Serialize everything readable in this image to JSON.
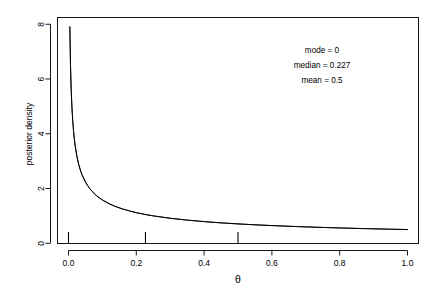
{
  "chart_data": {
    "type": "line",
    "title": "",
    "xlabel": "θ",
    "ylabel": "posterior density",
    "xlim": [
      0,
      1
    ],
    "ylim": [
      0,
      8
    ],
    "grid": false,
    "legend": "none",
    "xticks": [
      "0.0",
      "0.2",
      "0.4",
      "0.6",
      "0.8",
      "1.0"
    ],
    "xtick_values": [
      0.0,
      0.2,
      0.4,
      0.6,
      0.8,
      1.0
    ],
    "yticks": [
      "0",
      "2",
      "4",
      "6",
      "8"
    ],
    "ytick_values": [
      0,
      2,
      4,
      6,
      8
    ],
    "series": [
      {
        "name": "posterior density",
        "formula": "0.5 * theta^(-0.5)",
        "x": [
          0.004,
          0.006,
          0.008,
          0.01,
          0.0125,
          0.015,
          0.0175,
          0.02,
          0.025,
          0.03,
          0.035,
          0.04,
          0.05,
          0.06,
          0.07,
          0.08,
          0.09,
          0.1,
          0.12,
          0.14,
          0.16,
          0.18,
          0.2,
          0.227,
          0.25,
          0.3,
          0.35,
          0.4,
          0.45,
          0.5,
          0.55,
          0.6,
          0.65,
          0.7,
          0.75,
          0.8,
          0.85,
          0.9,
          0.95,
          1.0
        ],
        "y": [
          7.906,
          6.455,
          5.59,
          5.0,
          4.472,
          4.082,
          3.78,
          3.536,
          3.162,
          2.887,
          2.673,
          2.5,
          2.236,
          2.041,
          1.89,
          1.768,
          1.667,
          1.581,
          1.443,
          1.336,
          1.25,
          1.179,
          1.118,
          1.049,
          1.0,
          0.913,
          0.845,
          0.791,
          0.745,
          0.707,
          0.674,
          0.645,
          0.62,
          0.598,
          0.577,
          0.559,
          0.542,
          0.527,
          0.513,
          0.5
        ]
      }
    ],
    "annotations": [
      {
        "name": "mode",
        "label": "mode = 0",
        "value": 0
      },
      {
        "name": "median",
        "label": "median = 0.227",
        "value": 0.227
      },
      {
        "name": "mean",
        "label": "mean = 0.5",
        "value": 0.5
      }
    ],
    "rug_marks": [
      0.0,
      0.227,
      0.5
    ]
  }
}
